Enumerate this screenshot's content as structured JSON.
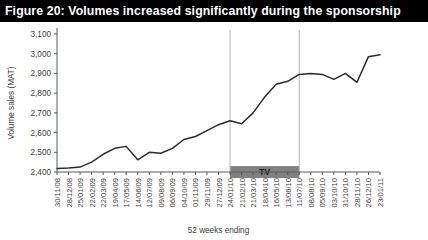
{
  "figure": {
    "title": "Figure 20: Volumes increased significantly during the sponsorship",
    "title_bg": "#000000",
    "title_color": "#ffffff"
  },
  "chart_data": {
    "type": "line",
    "title": "Figure 20: Volumes increased significantly during the sponsorship",
    "xlabel": "52 weeks ending",
    "ylabel": "Volume sales (MAT)",
    "ylim": [
      2400,
      3100
    ],
    "yticks": [
      2400,
      2500,
      2600,
      2700,
      2800,
      2900,
      3000,
      3100
    ],
    "ytick_labels": [
      "2,400",
      "2,500",
      "2,600",
      "2,700",
      "2,800",
      "2,900",
      "3,000",
      "3,100"
    ],
    "grid": false,
    "legend": "none",
    "line_color": "#2b2b2b",
    "categories": [
      "30/11/08",
      "28/12/08",
      "25/01/09",
      "22/02/09",
      "22/03/09",
      "19/04/09",
      "17/05/09",
      "14/06/09",
      "12/07/09",
      "09/08/09",
      "06/09/09",
      "04/10/09",
      "01/11/09",
      "29/11/09",
      "27/12/09",
      "24/01/10",
      "21/02/10",
      "21/03/10",
      "18/04/10",
      "16/05/10",
      "13/06/10",
      "11/07/10",
      "08/08/10",
      "05/09/10",
      "03/10/10",
      "31/10/10",
      "28/11/10",
      "26/12/10",
      "23/01/11"
    ],
    "values": [
      2418,
      2420,
      2425,
      2450,
      2490,
      2520,
      2530,
      2462,
      2500,
      2495,
      2520,
      2565,
      2580,
      2610,
      2640,
      2660,
      2645,
      2700,
      2780,
      2845,
      2860,
      2895,
      2900,
      2895,
      2870,
      2900,
      2855,
      2985,
      2995
    ],
    "annotations": [
      {
        "type": "band",
        "label": "TV",
        "color": "#808080",
        "start_category": "24/01/10",
        "end_category": "11/07/10",
        "value_level": 2430
      },
      {
        "type": "vline",
        "at_category": "24/01/10",
        "color": "#b4b4b4"
      },
      {
        "type": "vline",
        "at_category": "11/07/10",
        "color": "#b4b4b4"
      }
    ]
  }
}
